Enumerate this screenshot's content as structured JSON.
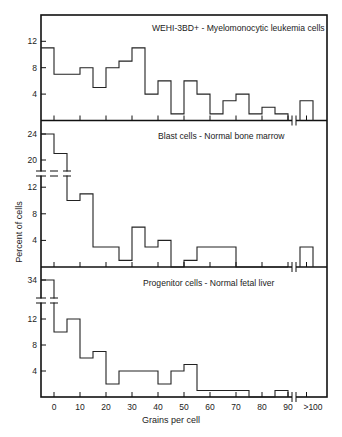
{
  "figure": {
    "ylabel": "Percent of cells",
    "xlabel": "Grains per cell"
  },
  "chart_data": [
    {
      "type": "bar",
      "subtype": "histogram",
      "title": "WEHI-3BD+ - Myelomonocytic leukemia cells",
      "xlabel": "Grains per cell",
      "ylabel": "Percent of cells",
      "bin_width": 5,
      "bins": [
        {
          "from": -5,
          "to": 0,
          "value": 11
        },
        {
          "from": 0,
          "to": 5,
          "value": 7
        },
        {
          "from": 5,
          "to": 10,
          "value": 7
        },
        {
          "from": 10,
          "to": 15,
          "value": 8
        },
        {
          "from": 15,
          "to": 20,
          "value": 5
        },
        {
          "from": 20,
          "to": 25,
          "value": 8
        },
        {
          "from": 25,
          "to": 30,
          "value": 9
        },
        {
          "from": 30,
          "to": 35,
          "value": 11
        },
        {
          "from": 35,
          "to": 40,
          "value": 4
        },
        {
          "from": 40,
          "to": 45,
          "value": 6
        },
        {
          "from": 45,
          "to": 50,
          "value": 1
        },
        {
          "from": 50,
          "to": 55,
          "value": 6
        },
        {
          "from": 55,
          "to": 60,
          "value": 4
        },
        {
          "from": 60,
          "to": 65,
          "value": 1
        },
        {
          "from": 65,
          "to": 70,
          "value": 3
        },
        {
          "from": 70,
          "to": 75,
          "value": 4
        },
        {
          "from": 75,
          "to": 80,
          "value": 1
        },
        {
          "from": 80,
          "to": 85,
          "value": 2
        },
        {
          "from": 85,
          "to": 90,
          "value": 1
        },
        {
          "from": ">100",
          "to": ">100",
          "value": 3
        }
      ],
      "yticks": [
        4,
        8,
        12
      ],
      "ylim": [
        0,
        15
      ],
      "axis_break": false
    },
    {
      "type": "bar",
      "subtype": "histogram",
      "title": "Blast cells - Normal bone marrow",
      "xlabel": "Grains per cell",
      "ylabel": "Percent of cells",
      "bin_width": 5,
      "bins": [
        {
          "from": -5,
          "to": 0,
          "value": 24
        },
        {
          "from": 0,
          "to": 5,
          "value": 21
        },
        {
          "from": 5,
          "to": 10,
          "value": 10
        },
        {
          "from": 10,
          "to": 15,
          "value": 11
        },
        {
          "from": 15,
          "to": 20,
          "value": 3
        },
        {
          "from": 20,
          "to": 25,
          "value": 3
        },
        {
          "from": 25,
          "to": 30,
          "value": 1
        },
        {
          "from": 30,
          "to": 35,
          "value": 6
        },
        {
          "from": 35,
          "to": 40,
          "value": 3
        },
        {
          "from": 40,
          "to": 45,
          "value": 4
        },
        {
          "from": 45,
          "to": 50,
          "value": 0
        },
        {
          "from": 50,
          "to": 55,
          "value": 1
        },
        {
          "from": 55,
          "to": 60,
          "value": 3
        },
        {
          "from": 60,
          "to": 65,
          "value": 3
        },
        {
          "from": 65,
          "to": 70,
          "value": 3
        },
        {
          "from": 70,
          "to": 75,
          "value": 0
        },
        {
          "from": 75,
          "to": 80,
          "value": 0
        },
        {
          "from": 80,
          "to": 85,
          "value": 0
        },
        {
          "from": 85,
          "to": 90,
          "value": 0
        },
        {
          "from": ">100",
          "to": ">100",
          "value": 3
        }
      ],
      "yticks": [
        4,
        8,
        12,
        20,
        24
      ],
      "ylim": [
        0,
        26
      ],
      "axis_break": true,
      "axis_break_between": [
        14,
        18
      ]
    },
    {
      "type": "bar",
      "subtype": "histogram",
      "title": "Progenitor cells - Normal fetal liver",
      "xlabel": "Grains per cell",
      "ylabel": "Percent of cells",
      "bin_width": 5,
      "bins": [
        {
          "from": -5,
          "to": 0,
          "value": 34
        },
        {
          "from": 0,
          "to": 5,
          "value": 10
        },
        {
          "from": 5,
          "to": 10,
          "value": 12
        },
        {
          "from": 10,
          "to": 15,
          "value": 6
        },
        {
          "from": 15,
          "to": 20,
          "value": 7
        },
        {
          "from": 20,
          "to": 25,
          "value": 2
        },
        {
          "from": 25,
          "to": 30,
          "value": 4
        },
        {
          "from": 30,
          "to": 35,
          "value": 4
        },
        {
          "from": 35,
          "to": 40,
          "value": 4
        },
        {
          "from": 40,
          "to": 45,
          "value": 2
        },
        {
          "from": 45,
          "to": 50,
          "value": 4
        },
        {
          "from": 50,
          "to": 55,
          "value": 5
        },
        {
          "from": 55,
          "to": 60,
          "value": 1
        },
        {
          "from": 60,
          "to": 65,
          "value": 1
        },
        {
          "from": 65,
          "to": 70,
          "value": 1
        },
        {
          "from": 70,
          "to": 75,
          "value": 1
        },
        {
          "from": 75,
          "to": 80,
          "value": 0
        },
        {
          "from": 80,
          "to": 85,
          "value": 0
        },
        {
          "from": 85,
          "to": 90,
          "value": 1
        },
        {
          "from": ">100",
          "to": ">100",
          "value": 0
        }
      ],
      "yticks": [
        4,
        8,
        12,
        34
      ],
      "ylim": [
        0,
        36
      ],
      "axis_break": true,
      "axis_break_between": [
        14,
        32
      ]
    }
  ],
  "xticks": [
    {
      "value": 0,
      "label": "0"
    },
    {
      "value": 10,
      "label": "10"
    },
    {
      "value": 20,
      "label": "20"
    },
    {
      "value": 30,
      "label": "30"
    },
    {
      "value": 40,
      "label": "40"
    },
    {
      "value": 50,
      "label": "50"
    },
    {
      "value": 60,
      "label": "60"
    },
    {
      "value": 70,
      "label": "70"
    },
    {
      "value": 80,
      "label": "80"
    },
    {
      "value": 90,
      "label": "90"
    },
    {
      "value": ">100",
      "label": ">100"
    }
  ],
  "colors": {
    "line": "#222222",
    "background": "#ffffff"
  }
}
